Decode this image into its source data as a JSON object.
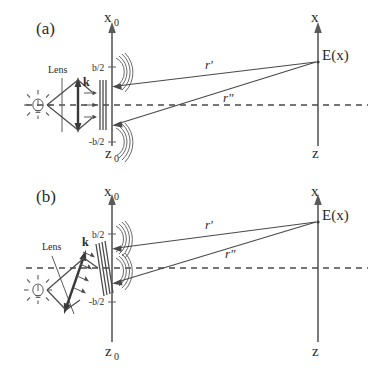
{
  "figure": {
    "panels": [
      {
        "id": "a",
        "label": "(a)",
        "description": "Normal incidence: lens and grating perpendicular to optical axis",
        "labels": {
          "lens": "Lens",
          "wavevector": "k",
          "aperture_top": "b/2",
          "aperture_bottom": "-b/2",
          "source_axis": "x",
          "source_axis_sub": "0",
          "source_plane": "z",
          "source_plane_sub": "0",
          "obs_axis": "x",
          "obs_plane": "z",
          "field": "E(x)",
          "ray_upper": "r'",
          "ray_lower": "r\""
        }
      },
      {
        "id": "b",
        "label": "(b)",
        "description": "Oblique incidence: lens and grating tilted relative to optical axis",
        "labels": {
          "lens": "Lens",
          "wavevector": "k",
          "aperture_top": "b/2",
          "aperture_bottom": "-b/2",
          "source_axis": "x",
          "source_axis_sub": "0",
          "source_plane": "z",
          "source_plane_sub": "0",
          "obs_axis": "x",
          "obs_plane": "z",
          "field": "E(x)",
          "ray_upper": "r'",
          "ray_lower": "r\""
        }
      }
    ],
    "colors": {
      "ink": "#2a2a2a",
      "line": "#4a4a4a",
      "background": "#ffffff"
    },
    "icons": {
      "light_source": "light-bulb-icon",
      "lens": "lens-icon",
      "grating": "grating-icon",
      "wavefront": "wavefront-arc-icon"
    }
  }
}
